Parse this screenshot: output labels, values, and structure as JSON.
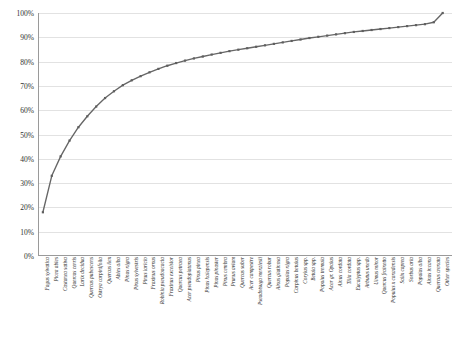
{
  "chart_data": {
    "type": "line",
    "title": "",
    "subtitle": "",
    "xlabel": "",
    "ylabel": "",
    "ylim": [
      0,
      100
    ],
    "y_tick_labels": [
      "0%",
      "10%",
      "20%",
      "30%",
      "40%",
      "50%",
      "60%",
      "70%",
      "80%",
      "90%",
      "100%"
    ],
    "y_tick_values": [
      0,
      10,
      20,
      30,
      40,
      50,
      60,
      70,
      80,
      90,
      100
    ],
    "grid": true,
    "legend": "none",
    "series_name": "Cumulative share",
    "line_color": "#666666",
    "marker_color": "#5f5f5f",
    "grid_color": "#e2e2e2",
    "axis_color": "#9a9a9a",
    "categories": [
      "Fagus sylvatica",
      "Picea abies",
      "Castanea sativa",
      "Quercus cerris",
      "Larix decidua",
      "Quercus pubescens",
      "Ostrya carpinifolia",
      "Quercus ilex",
      "Abies alba",
      "Pinus nigra",
      "Pinus sylvestris",
      "Pinus laricio",
      "Fraxinus ornus",
      "Robinia pseudoacacia",
      "Fraxinus excelsior",
      "Quercus petraea",
      "Acer pseudoplatanus",
      "Pinus pinea",
      "Pinus halepensis",
      "Pinus pinaster",
      "Pinus cembra",
      "Prunus avium",
      "Quercus suber",
      "Acer campestre",
      "Pseudotsuga menziesii",
      "Quercus robur",
      "Alnus glutinosa",
      "Populus nigra",
      "Carpinus betulus",
      "Corylus spp.",
      "Betula spp.",
      "Populus tremula",
      "Acer gr. Opalus",
      "Alnus cordata",
      "Tilia cordata",
      "Eucalyptus spp.",
      "Arbutus unedo",
      "Ulmus minor",
      "Quercus frainetto",
      "Populus x canadensis",
      "Salix caprea",
      "Sorbus aria",
      "Populus alba",
      "Alnus incana",
      "Quercus crenata",
      "Other species"
    ],
    "values": [
      18.0,
      33.0,
      41.0,
      47.5,
      53.0,
      57.5,
      61.5,
      65.0,
      67.8,
      70.3,
      72.3,
      74.0,
      75.6,
      77.0,
      78.3,
      79.4,
      80.4,
      81.3,
      82.1,
      82.9,
      83.6,
      84.3,
      84.9,
      85.5,
      86.1,
      86.7,
      87.3,
      87.9,
      88.5,
      89.1,
      89.7,
      90.2,
      90.7,
      91.2,
      91.7,
      92.2,
      92.6,
      93.0,
      93.4,
      93.8,
      94.2,
      94.6,
      95.0,
      95.4,
      96.2,
      100.0
    ]
  }
}
